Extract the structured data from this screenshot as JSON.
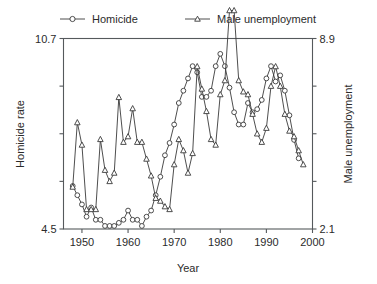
{
  "chart_data": {
    "type": "line",
    "title": "",
    "xlabel": "Year",
    "ylabel": "Homicide rate",
    "y2label": "Male unemployment",
    "xlim": [
      1946,
      2000
    ],
    "ylim": [
      4.5,
      10.7
    ],
    "y2lim": [
      2.1,
      8.9
    ],
    "grid": false,
    "legend_position": "top",
    "x_ticks": [
      1950,
      1960,
      1970,
      1980,
      1990,
      2000
    ],
    "x_tick_labels": [
      "1950",
      "1960",
      "1970",
      "1980",
      "1990",
      "2000"
    ],
    "y_ticks": [
      4.5,
      6.05,
      7.6,
      9.15,
      10.7
    ],
    "y_tick_labels": [
      "4.5",
      "",
      "",
      "",
      "10.7"
    ],
    "y2_ticks": [
      2.1,
      3.8,
      5.5,
      7.2,
      8.9
    ],
    "y2_tick_labels": [
      "2.1",
      "",
      "",
      "",
      "8.9"
    ],
    "series": [
      {
        "name": "Homicide",
        "marker": "circle",
        "axis": "left",
        "x": [
          1948,
          1949,
          1950,
          1951,
          1952,
          1953,
          1954,
          1955,
          1956,
          1957,
          1958,
          1959,
          1960,
          1961,
          1962,
          1963,
          1964,
          1965,
          1966,
          1967,
          1968,
          1969,
          1970,
          1971,
          1972,
          1973,
          1974,
          1975,
          1976,
          1977,
          1978,
          1979,
          1980,
          1981,
          1982,
          1983,
          1984,
          1985,
          1986,
          1987,
          1988,
          1989,
          1990,
          1991,
          1992,
          1993,
          1994,
          1995,
          1996,
          1997
        ],
        "values": [
          5.9,
          5.6,
          5.3,
          4.9,
          5.2,
          4.8,
          4.8,
          4.6,
          4.6,
          4.6,
          4.7,
          4.8,
          5.1,
          4.8,
          4.8,
          4.6,
          4.9,
          5.1,
          5.6,
          6.2,
          6.9,
          7.3,
          7.9,
          8.6,
          9.0,
          9.4,
          9.8,
          9.6,
          8.8,
          8.8,
          9.0,
          9.8,
          10.2,
          9.8,
          9.1,
          8.3,
          7.9,
          7.9,
          8.6,
          8.3,
          8.4,
          8.7,
          9.4,
          9.8,
          9.3,
          9.5,
          9.0,
          8.2,
          7.4,
          6.8
        ]
      },
      {
        "name": "Male unemployment",
        "marker": "triangle",
        "axis": "right",
        "x": [
          1948,
          1949,
          1950,
          1951,
          1952,
          1953,
          1954,
          1955,
          1956,
          1957,
          1958,
          1959,
          1960,
          1961,
          1962,
          1963,
          1964,
          1965,
          1966,
          1967,
          1968,
          1969,
          1970,
          1971,
          1972,
          1973,
          1974,
          1975,
          1976,
          1977,
          1978,
          1979,
          1980,
          1981,
          1982,
          1983,
          1984,
          1985,
          1986,
          1987,
          1988,
          1989,
          1990,
          1991,
          1992,
          1993,
          1994,
          1995,
          1996,
          1997,
          1998
        ],
        "values": [
          3.6,
          5.9,
          5.1,
          2.8,
          2.8,
          2.8,
          5.3,
          4.2,
          3.8,
          4.1,
          6.8,
          5.2,
          5.4,
          6.4,
          5.2,
          5.2,
          4.6,
          4.0,
          3.2,
          3.1,
          2.9,
          2.8,
          4.4,
          5.3,
          4.9,
          4.1,
          4.8,
          7.9,
          7.1,
          6.3,
          5.3,
          5.1,
          6.9,
          7.4,
          9.9,
          9.9,
          7.4,
          7.0,
          6.9,
          6.2,
          5.5,
          5.2,
          5.7,
          7.2,
          7.9,
          7.2,
          6.2,
          5.6,
          5.4,
          4.9,
          4.4
        ]
      }
    ]
  },
  "legend": {
    "entries": [
      {
        "label": "Homicide",
        "marker": "circle"
      },
      {
        "label": "Male unemployment",
        "marker": "triangle"
      }
    ]
  },
  "axes": {
    "left_title": "Homicide rate",
    "right_title": "Male unemployment",
    "bottom_title": "Year",
    "left_min_label": "4.5",
    "left_max_label": "10.7",
    "right_min_label": "2.1",
    "right_max_label": "8.9"
  },
  "colors": {
    "line": "#3a3a3a",
    "axis": "#55595c",
    "text": "#2b2b2b",
    "background": "#ffffff",
    "marker_fill": "#ffffff"
  }
}
